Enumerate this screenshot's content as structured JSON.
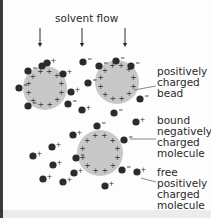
{
  "diagram": {
    "title": "solvent flow",
    "labels": {
      "bead": "positively\ncharged\nbead",
      "bound": "bound\nnegatively\ncharged\nmolecule",
      "free": "free\npositively\ncharged\nmolecule"
    },
    "colors": {
      "bead_fill": "#c8c8c8",
      "molecule_fill": "#2b2b2b",
      "text": "#2a2a2a",
      "arrow": "#2a2a2a"
    },
    "arrows": [
      {
        "x": 40,
        "y1": 28,
        "y2": 47
      },
      {
        "x": 82,
        "y1": 28,
        "y2": 47
      },
      {
        "x": 125,
        "y1": 28,
        "y2": 47
      }
    ],
    "beads": [
      {
        "cx": 45,
        "cy": 88,
        "r": 22
      },
      {
        "cx": 117,
        "cy": 82,
        "r": 22
      },
      {
        "cx": 100,
        "cy": 153,
        "r": 23
      }
    ],
    "bound_molecules": [
      {
        "cx": 28,
        "cy": 71,
        "sign": "-"
      },
      {
        "cx": 19,
        "cy": 88,
        "sign": "-"
      },
      {
        "cx": 28,
        "cy": 106,
        "sign": "-"
      },
      {
        "cx": 42,
        "cy": 66,
        "sign": "-"
      },
      {
        "cx": 68,
        "cy": 104,
        "sign": "-"
      },
      {
        "cx": 99,
        "cy": 66,
        "sign": "-"
      },
      {
        "cx": 116,
        "cy": 61,
        "sign": "-"
      },
      {
        "cx": 131,
        "cy": 66,
        "sign": "-"
      },
      {
        "cx": 88,
        "cy": 83,
        "sign": "-"
      },
      {
        "cx": 140,
        "cy": 99,
        "sign": "-"
      },
      {
        "cx": 114,
        "cy": 113,
        "sign": "-"
      },
      {
        "cx": 97,
        "cy": 126,
        "sign": "-"
      },
      {
        "cx": 76,
        "cy": 158,
        "sign": "-"
      },
      {
        "cx": 124,
        "cy": 140,
        "sign": "-"
      },
      {
        "cx": 122,
        "cy": 170,
        "sign": "-"
      },
      {
        "cx": 83,
        "cy": 62,
        "sign": "-"
      }
    ],
    "free_molecules": [
      {
        "cx": 47,
        "cy": 63,
        "sign": "+"
      },
      {
        "cx": 63,
        "cy": 74,
        "sign": "+"
      },
      {
        "cx": 71,
        "cy": 92,
        "sign": "+"
      },
      {
        "cx": 82,
        "cy": 110,
        "sign": "+"
      },
      {
        "cx": 73,
        "cy": 135,
        "sign": "+"
      },
      {
        "cx": 52,
        "cy": 147,
        "sign": "+"
      },
      {
        "cx": 33,
        "cy": 156,
        "sign": "+"
      },
      {
        "cx": 53,
        "cy": 165,
        "sign": "+"
      },
      {
        "cx": 74,
        "cy": 173,
        "sign": "+"
      },
      {
        "cx": 43,
        "cy": 179,
        "sign": "+"
      },
      {
        "cx": 63,
        "cy": 182,
        "sign": "+"
      },
      {
        "cx": 105,
        "cy": 186,
        "sign": "+"
      },
      {
        "cx": 136,
        "cy": 122,
        "sign": "+"
      },
      {
        "cx": 137,
        "cy": 172,
        "sign": "+"
      }
    ]
  }
}
